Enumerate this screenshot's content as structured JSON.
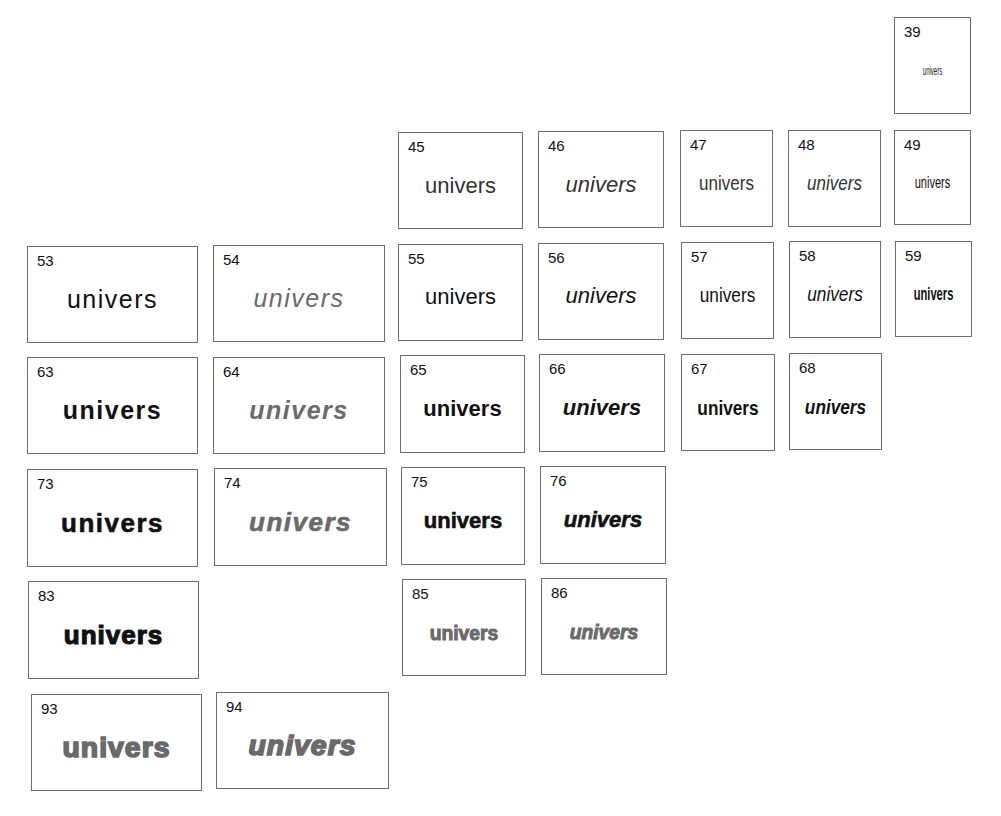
{
  "specimen": {
    "sample_word": "univers",
    "cells": [
      {
        "number": "39",
        "style": "ultra-light condensed"
      },
      {
        "number": "45",
        "style": "light"
      },
      {
        "number": "46",
        "style": "light oblique"
      },
      {
        "number": "47",
        "style": "light condensed"
      },
      {
        "number": "48",
        "style": "light condensed oblique"
      },
      {
        "number": "49",
        "style": "light ultra condensed"
      },
      {
        "number": "53",
        "style": "medium extended"
      },
      {
        "number": "54",
        "style": "medium extended oblique"
      },
      {
        "number": "55",
        "style": "roman"
      },
      {
        "number": "56",
        "style": "oblique"
      },
      {
        "number": "57",
        "style": "condensed"
      },
      {
        "number": "58",
        "style": "condensed oblique"
      },
      {
        "number": "59",
        "style": "ultra condensed"
      },
      {
        "number": "63",
        "style": "bold extended"
      },
      {
        "number": "64",
        "style": "bold extended oblique"
      },
      {
        "number": "65",
        "style": "bold"
      },
      {
        "number": "66",
        "style": "bold oblique"
      },
      {
        "number": "67",
        "style": "bold condensed"
      },
      {
        "number": "68",
        "style": "bold condensed oblique"
      },
      {
        "number": "73",
        "style": "black extended"
      },
      {
        "number": "74",
        "style": "black extended oblique"
      },
      {
        "number": "75",
        "style": "black"
      },
      {
        "number": "76",
        "style": "black oblique"
      },
      {
        "number": "83",
        "style": "extra black extended"
      },
      {
        "number": "85",
        "style": "extra black"
      },
      {
        "number": "86",
        "style": "extra black oblique"
      },
      {
        "number": "93",
        "style": "ultra black extended"
      },
      {
        "number": "94",
        "style": "ultra black extended oblique"
      }
    ]
  },
  "colors": {
    "border": "#6e6e6e",
    "ink": "#111111",
    "gray_ink": "#6a6a6a"
  }
}
